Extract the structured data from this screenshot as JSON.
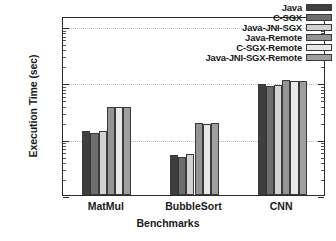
{
  "chart_data": {
    "type": "bar",
    "title": "",
    "xlabel": "Benchmarks",
    "ylabel": "Execution Time (sec)",
    "yscale": "log",
    "ylim": [
      0.1,
      150
    ],
    "ytick_labels": [
      "0.1",
      "1",
      "10",
      "100"
    ],
    "ytick_values": [
      0.1,
      1,
      10,
      100
    ],
    "grid": true,
    "legend_position": "top-right",
    "categories": [
      "MatMul",
      "BubbleSort",
      "CNN"
    ],
    "series": [
      {
        "name": "Java",
        "color": "#3f3f3f",
        "values": [
          1.35,
          0.52,
          9.5
        ]
      },
      {
        "name": "C-SGX",
        "color": "#6e6e6e",
        "values": [
          1.25,
          0.47,
          8.6
        ]
      },
      {
        "name": "Java-JNI-SGX",
        "color": "#d2d2d2",
        "values": [
          1.35,
          0.53,
          8.8
        ]
      },
      {
        "name": "Java-Remote",
        "color": "#949494",
        "values": [
          3.6,
          1.9,
          11.0
        ]
      },
      {
        "name": "C-SGX-Remote",
        "color": "#e8e8e8",
        "values": [
          3.6,
          1.85,
          10.5
        ]
      },
      {
        "name": "Java-JNI-SGX-Remote",
        "color": "#9e9e9e",
        "values": [
          3.6,
          1.9,
          10.6
        ]
      }
    ]
  },
  "axes": {
    "y_title": "Execution Time (sec)",
    "x_title": "Benchmarks"
  },
  "legend": {
    "items": [
      {
        "label": "Java"
      },
      {
        "label": "C-SGX"
      },
      {
        "label": "Java-JNI-SGX"
      },
      {
        "label": "Java-Remote"
      },
      {
        "label": "C-SGX-Remote"
      },
      {
        "label": "Java-JNI-SGX-Remote"
      }
    ]
  }
}
